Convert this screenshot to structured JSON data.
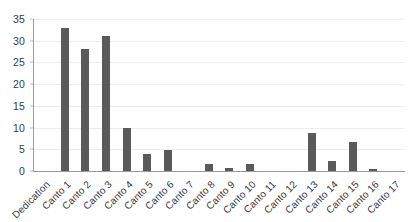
{
  "chart_data": {
    "type": "bar",
    "title": "",
    "subtitle": "",
    "xlabel": "",
    "ylabel": "",
    "ylim": [
      0,
      35
    ],
    "ytick_labels": [
      "0",
      "5",
      "10",
      "15",
      "20",
      "25",
      "30",
      "35"
    ],
    "yticks": [
      0,
      5,
      10,
      15,
      20,
      25,
      30,
      35
    ],
    "grid": true,
    "legend": false,
    "legend_position": "none",
    "bar_color": "#5a5a5a",
    "gridline_color": "#ededed",
    "axis_color": "#9a9a9a",
    "text_color": "#3a3a3a",
    "background_color": "#ffffff",
    "categories": [
      "Dedication",
      "Canto 1",
      "Canto 2",
      "Canto 3",
      "Canto 4",
      "Canto 5",
      "Canto 6",
      "Canto 7",
      "Canto 8",
      "Canto 9",
      "Canto 10",
      "Canto 11",
      "Canto 12",
      "Canto 13",
      "Canto 14",
      "Canto 15",
      "Canto 16",
      "Canto 17"
    ],
    "values": [
      0,
      33,
      28,
      31,
      10,
      3.9,
      4.8,
      0,
      1.6,
      0.6,
      1.6,
      0,
      0,
      8.7,
      2.4,
      6.6,
      0.5,
      0
    ]
  }
}
